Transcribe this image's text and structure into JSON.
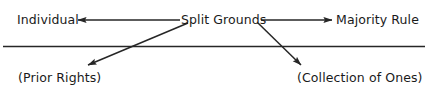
{
  "diagram": {
    "type": "node-arrow-diagram",
    "canvas": {
      "width": 429,
      "height": 95,
      "background": "#ffffff"
    },
    "stroke_color": "#262626",
    "text_color": "#1a1a1a",
    "nodes": {
      "center": {
        "label": "Split Grounds",
        "x": 181,
        "y": 13
      },
      "left": {
        "label": "Individual",
        "x": 17,
        "y": 13
      },
      "right": {
        "label": "Majority Rule",
        "x": 336,
        "y": 13
      },
      "lower_left": {
        "label": "(Prior Rights)",
        "x": 18,
        "y": 71
      },
      "lower_right": {
        "label": "(Collection of Ones)",
        "x": 297,
        "y": 71
      }
    },
    "connectors": [
      {
        "name": "split-grounds-to-individual",
        "from": "Split Grounds",
        "to": "Individual",
        "direction": "left",
        "arrowhead": "end",
        "x1": 180,
        "y1": 20,
        "x2": 78,
        "y2": 20
      },
      {
        "name": "split-grounds-to-majority-rule",
        "from": "Split Grounds",
        "to": "Majority Rule",
        "direction": "right",
        "arrowhead": "end",
        "x1": 261,
        "y1": 20,
        "x2": 332,
        "y2": 20
      },
      {
        "name": "split-grounds-to-prior-rights",
        "from": "Split Grounds",
        "to": "(Prior Rights)",
        "direction": "down-left",
        "arrowhead": "end",
        "x1": 188,
        "y1": 23,
        "x2": 87,
        "y2": 65
      },
      {
        "name": "split-grounds-to-collection-of-ones",
        "from": "Split Grounds",
        "to": "(Collection of Ones)",
        "direction": "down-right",
        "arrowhead": "end",
        "x1": 258,
        "y1": 23,
        "x2": 302,
        "y2": 66
      }
    ],
    "divider": {
      "name": "horizontal-rule",
      "x1": 3,
      "y1": 46.5,
      "x2": 425,
      "y2": 46.5,
      "thickness": 1.6
    }
  }
}
